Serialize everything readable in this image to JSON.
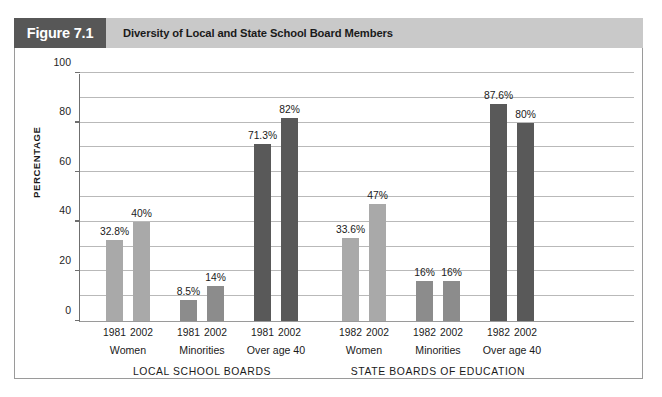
{
  "header": {
    "figure_number": "Figure 7.1",
    "title": "Diversity of Local and State School Board Members",
    "number_box_color": "#575757",
    "title_bar_color": "#c9c9c9"
  },
  "chart_data": {
    "type": "bar",
    "title": "Diversity of Local and State School Board Members",
    "xlabel": "",
    "ylabel": "PERCENTAGE",
    "ylim": [
      0,
      100
    ],
    "yticks": [
      0,
      20,
      40,
      60,
      80,
      100
    ],
    "ytick_labels": [
      "0",
      "20",
      "40",
      "60",
      "80",
      "100"
    ],
    "gridlines": [
      10,
      20,
      30,
      40,
      50,
      60,
      70,
      80,
      90,
      100
    ],
    "grid": true,
    "legend": "none",
    "value_suffix": "%",
    "panels": [
      {
        "name": "LOCAL SCHOOL BOARDS",
        "groups": [
          {
            "category": "Women",
            "color": "#a9a9a9",
            "bars": [
              {
                "year": "1981",
                "value": 32.8,
                "label": "32.8%"
              },
              {
                "year": "2002",
                "value": 40,
                "label": "40%"
              }
            ]
          },
          {
            "category": "Minorities",
            "color": "#8c8c8c",
            "bars": [
              {
                "year": "1981",
                "value": 8.5,
                "label": "8.5%"
              },
              {
                "year": "2002",
                "value": 14,
                "label": "14%"
              }
            ]
          },
          {
            "category": "Over age 40",
            "color": "#595959",
            "bars": [
              {
                "year": "1981",
                "value": 71.3,
                "label": "71.3%"
              },
              {
                "year": "2002",
                "value": 82,
                "label": "82%"
              }
            ]
          }
        ]
      },
      {
        "name": "STATE BOARDS OF EDUCATION",
        "groups": [
          {
            "category": "Women",
            "color": "#a9a9a9",
            "bars": [
              {
                "year": "1982",
                "value": 33.6,
                "label": "33.6%"
              },
              {
                "year": "2002",
                "value": 47,
                "label": "47%"
              }
            ]
          },
          {
            "category": "Minorities",
            "color": "#8c8c8c",
            "bars": [
              {
                "year": "1982",
                "value": 16,
                "label": "16%"
              },
              {
                "year": "2002",
                "value": 16,
                "label": "16%"
              }
            ]
          },
          {
            "category": "Over age 40",
            "color": "#595959",
            "bars": [
              {
                "year": "1982",
                "value": 87.6,
                "label": "87.6%"
              },
              {
                "year": "2002",
                "value": 80,
                "label": "80%"
              }
            ]
          }
        ]
      }
    ]
  }
}
